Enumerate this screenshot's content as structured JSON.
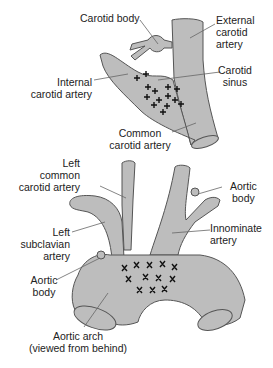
{
  "colors": {
    "vessel_fill": "#bdbdbd",
    "vessel_stroke": "#555555",
    "marker": "#111111",
    "leader": "#555555"
  },
  "top_figure": {
    "labels": {
      "carotid_body": [
        "Carotid body"
      ],
      "external_carotid": [
        "External",
        "carotid",
        "artery"
      ],
      "internal_carotid": [
        "Internal",
        "carotid artery"
      ],
      "carotid_sinus": [
        "Carotid",
        "sinus"
      ],
      "common_carotid": [
        "Common",
        "carotid artery"
      ]
    },
    "marker_glyph": "+",
    "marker_count": 14
  },
  "bottom_figure": {
    "labels": {
      "left_common_carotid": [
        "Left",
        "common",
        "carotid artery"
      ],
      "aortic_body_right": [
        "Aortic",
        "body"
      ],
      "innominate": [
        "Innominate",
        "artery"
      ],
      "left_subclavian": [
        "Left",
        "subclavian",
        "artery"
      ],
      "aortic_body_left": [
        "Aortic",
        "body"
      ],
      "aortic_arch": [
        "Aortic arch",
        "(viewed from behind)"
      ]
    },
    "marker_glyph": "x",
    "marker_count": 13
  }
}
